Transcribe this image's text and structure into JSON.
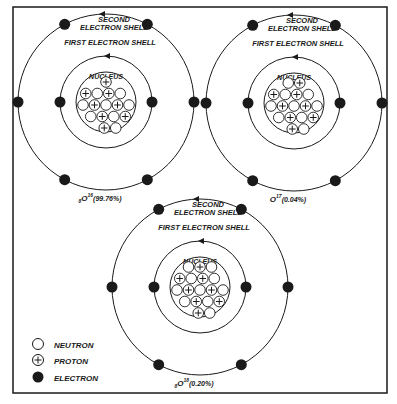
{
  "figure": {
    "colors": {
      "ink": "#1a1a1a",
      "paper": "#ffffff"
    },
    "frame": {
      "x": 13,
      "y": 7,
      "w": 374,
      "h": 386
    }
  },
  "labels": {
    "second_shell_line1": "SECOND",
    "second_shell_line2": "ELECTRON SHELL",
    "first_shell": "FIRST ELECTRON SHELL",
    "nucleus": "NUCLEUS"
  },
  "atoms": [
    {
      "id": "o16",
      "isotope_prefix": "8",
      "symbol": "O",
      "mass": "16",
      "abundance": "(99.76%)",
      "cx": 106,
      "cy": 102,
      "nucleus_rows": [
        [
          "p"
        ],
        [
          "p",
          "n",
          "p",
          "n"
        ],
        [
          "n",
          "p",
          "n",
          "p",
          "n"
        ],
        [
          "n",
          "p",
          "n",
          "p"
        ],
        [
          "p",
          "n"
        ]
      ]
    },
    {
      "id": "o17",
      "isotope_prefix": "",
      "symbol": "O",
      "mass": "17",
      "abundance": "(0.04%)",
      "cx": 294,
      "cy": 103,
      "nucleus_rows": [
        [
          "n",
          "p"
        ],
        [
          "p",
          "n",
          "p",
          "n"
        ],
        [
          "n",
          "p",
          "n",
          "p",
          "n"
        ],
        [
          "n",
          "p",
          "n",
          "p"
        ],
        [
          "p",
          "n"
        ]
      ]
    },
    {
      "id": "o18",
      "isotope_prefix": "8",
      "symbol": "O",
      "mass": "18",
      "abundance": "(0.20%)",
      "cx": 200,
      "cy": 287,
      "nucleus_rows": [
        [
          "n",
          "p",
          "n"
        ],
        [
          "p",
          "n",
          "p",
          "n"
        ],
        [
          "n",
          "p",
          "n",
          "p",
          "n"
        ],
        [
          "n",
          "p",
          "n",
          "p"
        ],
        [
          "p",
          "n"
        ]
      ]
    }
  ],
  "legend": {
    "items": [
      {
        "symbol": "open-circle",
        "label": "NEUTRON"
      },
      {
        "symbol": "plus-circle",
        "label": "PROTON"
      },
      {
        "symbol": "filled-circle",
        "label": "ELECTRON"
      }
    ]
  }
}
